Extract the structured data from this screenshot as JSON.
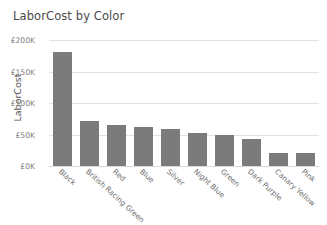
{
  "chart_data": {
    "type": "bar",
    "title": "LaborCost by Color",
    "xlabel": "",
    "ylabel": "LaborCost",
    "categories": [
      "Black",
      "British Racing Green",
      "Red",
      "Blue",
      "Silver",
      "Night Blue",
      "Green",
      "Dark Purple",
      "Canary Yellow",
      "Pink"
    ],
    "values": [
      181000,
      71000,
      65000,
      62000,
      58000,
      53000,
      50000,
      43000,
      21000,
      20000
    ],
    "ylim": [
      0,
      200000
    ],
    "yticks": [
      0,
      50000,
      100000,
      150000,
      200000
    ],
    "ytick_labels": [
      "£0K",
      "£50K",
      "£100K",
      "£150K",
      "£200K"
    ],
    "grid": true,
    "legend": false,
    "bar_color": "#7b7b7b",
    "grid_color": "#e2e2e2",
    "text_color": "#6e6e6e",
    "background": "#ffffff"
  }
}
